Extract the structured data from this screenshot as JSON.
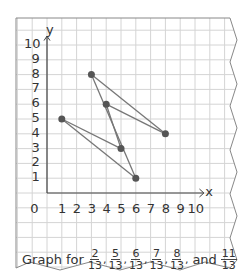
{
  "chart_data": {
    "type": "scatter",
    "title": "",
    "xlabel": "x",
    "ylabel": "y",
    "xlim": [
      0,
      10
    ],
    "ylim": [
      0,
      10
    ],
    "grid": true,
    "x_ticks": [
      "0",
      "1",
      "2",
      "3",
      "4",
      "5",
      "6",
      "7",
      "8",
      "9",
      "10"
    ],
    "y_ticks": [
      "1",
      "2",
      "3",
      "4",
      "5",
      "6",
      "7",
      "8",
      "9",
      "10"
    ],
    "points": [
      {
        "x": 1,
        "y": 5
      },
      {
        "x": 3,
        "y": 8
      },
      {
        "x": 4,
        "y": 6
      },
      {
        "x": 5,
        "y": 3
      },
      {
        "x": 6,
        "y": 1
      },
      {
        "x": 8,
        "y": 4
      }
    ],
    "segments": [
      [
        [
          1,
          5
        ],
        [
          5,
          3
        ]
      ],
      [
        [
          1,
          5
        ],
        [
          6,
          1
        ]
      ],
      [
        [
          3,
          8
        ],
        [
          6,
          1
        ]
      ],
      [
        [
          3,
          8
        ],
        [
          8,
          4
        ]
      ],
      [
        [
          4,
          6
        ],
        [
          8,
          4
        ]
      ],
      [
        [
          4,
          6
        ],
        [
          5,
          3
        ]
      ]
    ],
    "point_color": "#555555",
    "line_color": "#777777"
  },
  "caption": {
    "prefix": "Graph for",
    "fractions": [
      {
        "num": "2",
        "den": "13"
      },
      {
        "num": "5",
        "den": "13"
      },
      {
        "num": "6",
        "den": "13"
      },
      {
        "num": "7",
        "den": "13"
      },
      {
        "num": "8",
        "den": "13"
      }
    ],
    "conjunction": "and",
    "last_fraction": {
      "num": "11",
      "den": "13"
    }
  },
  "axes": {
    "x_label": "x",
    "y_label": "y",
    "origin": "0"
  }
}
